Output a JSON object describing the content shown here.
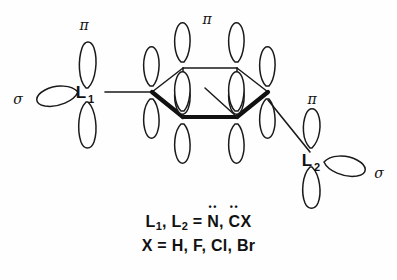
{
  "figure": {
    "kind": "orbital-diagram",
    "background_color": "#fefefe",
    "ink_color": "#111111",
    "ligand_1": {
      "label": "L",
      "subscript": "1",
      "pi_label": "π",
      "sigma_label": "σ"
    },
    "ligand_2": {
      "label": "L",
      "subscript": "2",
      "pi_label": "π",
      "sigma_label": "σ"
    },
    "ring": {
      "pi_label": "π",
      "vertex_count": 6,
      "orbital_count": 6
    }
  },
  "caption": {
    "line1_prefix": "L",
    "line1_sub1": "1",
    "line1_mid": ", L",
    "line1_sub2": "2",
    "line1_eq": " = ",
    "line1_atom1": "N",
    "line1_atom1_dots": "••",
    "line1_sep": ", ",
    "line1_atom2": "C",
    "line1_atom2_dots": "••",
    "line1_tail": "X",
    "line2": "X = H, F, Cl, Br"
  }
}
